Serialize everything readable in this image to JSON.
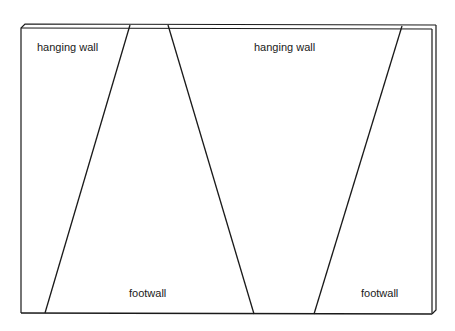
{
  "diagram": {
    "labels": {
      "hanging_wall_left": "hanging wall",
      "hanging_wall_right": "hanging wall",
      "footwall_center": "footwall",
      "footwall_right": "footwall"
    },
    "colors": {
      "line": "#1a1a1a",
      "background": "#ffffff"
    }
  }
}
